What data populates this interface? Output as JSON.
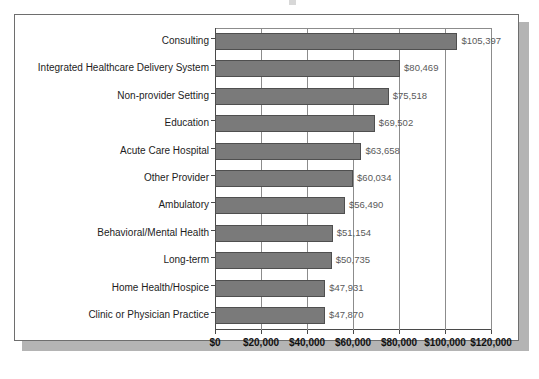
{
  "chart_data": {
    "type": "bar",
    "orientation": "horizontal",
    "title": "",
    "subtitle": "",
    "xlabel": "",
    "ylabel": "",
    "xlim": [
      0,
      120000
    ],
    "xticks": [
      0,
      20000,
      40000,
      60000,
      80000,
      100000,
      120000
    ],
    "xtick_labels": [
      "$0",
      "$20,000",
      "$40,000",
      "$60,000",
      "$80,000",
      "$100,000",
      "$120,000"
    ],
    "grid": "vertical",
    "legend": "none",
    "bar_color": "#7a7a7a",
    "bar_border_color": "#4f4f4f",
    "label_color": "#5a5a5a",
    "axis_color": "#4a4a4a",
    "gridline_color": "#8c8c8c",
    "frame_border_color": "#6e6e6e",
    "shadow_color": "#b4b4b4",
    "categories": [
      "Consulting",
      "Integrated Healthcare Delivery System",
      "Non-provider Setting",
      "Education",
      "Acute Care Hospital",
      "Other Provider",
      "Ambulatory",
      "Behavioral/Mental Health",
      "Long-term",
      "Home Health/Hospice",
      "Clinic or Physician Practice"
    ],
    "values": [
      105397,
      80469,
      75518,
      69502,
      63658,
      60034,
      56490,
      51154,
      50735,
      47931,
      47870
    ],
    "value_labels": [
      "$105,397",
      "$80,469",
      "$75,518",
      "$69,502",
      "$63,658",
      "$60,034",
      "$56,490",
      "$51,154",
      "$50,735",
      "$47,931",
      "$47,870"
    ]
  }
}
